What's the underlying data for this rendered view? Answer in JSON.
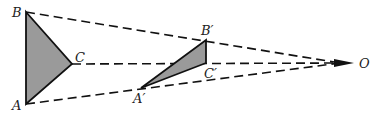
{
  "diagram": {
    "labels": {
      "B": "B",
      "C": "C",
      "A": "A",
      "B_prime": "B′",
      "C_prime": "C′",
      "A_prime": "A′",
      "O": "O"
    },
    "colors": {
      "fill": "#9a9a9a",
      "stroke": "#111111",
      "background": "#ffffff"
    }
  }
}
